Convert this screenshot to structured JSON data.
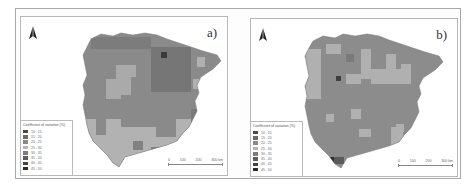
{
  "figure": {
    "panels": [
      {
        "id": "a",
        "label": "a)",
        "legend": {
          "title": "Coefficient of variation (%)",
          "classes": [
            {
              "label": "10 - 15",
              "color": "#4a4a4a"
            },
            {
              "label": "15 - 20",
              "color": "#6a6a6a"
            },
            {
              "label": "20 - 25",
              "color": "#8a8a8a"
            },
            {
              "label": "25 - 30",
              "color": "#b4b4b4"
            },
            {
              "label": "30 - 35",
              "color": "#7c7c7c"
            },
            {
              "label": "35 - 40",
              "color": "#5e5e5e"
            },
            {
              "label": "40 - 45",
              "color": "#444444"
            },
            {
              "label": "45 - 50",
              "color": "#2a2a2a"
            }
          ]
        },
        "scalebar": {
          "ticks": [
            "0",
            "100",
            "200",
            "300 km"
          ]
        },
        "north_arrow": "north-arrow-icon"
      },
      {
        "id": "b",
        "label": "b)",
        "legend": {
          "title": "Coefficient of variation (%)",
          "classes": [
            {
              "label": "10 - 15",
              "color": "#4a4a4a"
            },
            {
              "label": "15 - 20",
              "color": "#6a6a6a"
            },
            {
              "label": "20 - 25",
              "color": "#8a8a8a"
            },
            {
              "label": "25 - 30",
              "color": "#b4b4b4"
            },
            {
              "label": "30 - 35",
              "color": "#7c7c7c"
            },
            {
              "label": "35 - 40",
              "color": "#5e5e5e"
            },
            {
              "label": "40 - 45",
              "color": "#444444"
            },
            {
              "label": "45 - 50",
              "color": "#2a2a2a"
            }
          ]
        },
        "scalebar": {
          "ticks": [
            "0",
            "100",
            "200",
            "300 km"
          ]
        },
        "north_arrow": "north-arrow-icon"
      }
    ],
    "colors": {
      "land_medium": "#8c8c8c",
      "land_dark": "#7a7a7a",
      "land_light": "#b2b2b2",
      "land_darkest": "#3e3e3e",
      "frame": "#a8a8a8"
    }
  }
}
